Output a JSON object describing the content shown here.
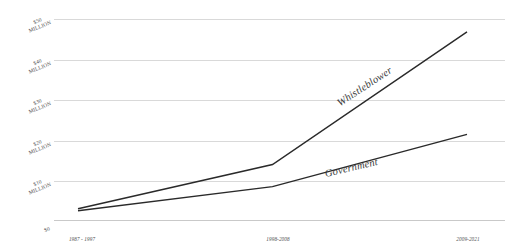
{
  "chart_data": {
    "type": "line",
    "title": "",
    "subtitle": "",
    "xlabel": "",
    "ylabel": "",
    "categories": [
      "1987 - 1997",
      "1998-2008",
      "2009-2021"
    ],
    "x": [
      0,
      1,
      2
    ],
    "ylim": [
      0,
      50
    ],
    "xlim": [
      0,
      2
    ],
    "y_unit": "millions of dollars",
    "grid": true,
    "legend_position": "inline-labels",
    "y_tick_values": [
      0,
      10,
      20,
      30,
      40,
      50
    ],
    "y_tick_labels": [
      "$0",
      "$10\nMILLION",
      "$20\nMILLION",
      "$30\nMILLION",
      "$40\nMILLION",
      "$50\nMILLION"
    ],
    "series": [
      {
        "name": "Whistleblower",
        "label": "Whistleblower",
        "color": "#2a2a2a",
        "values": [
          2.8,
          13.8,
          46.8
        ]
      },
      {
        "name": "Government",
        "label": "Government",
        "color": "#2a2a2a",
        "values": [
          2.3,
          8.3,
          21.3
        ]
      }
    ],
    "annotations": [
      {
        "text": "Whistleblower",
        "style": "italic",
        "placement": "along-upper-line"
      },
      {
        "text": "Government",
        "style": "italic",
        "placement": "along-lower-line"
      }
    ]
  },
  "colors": {
    "background": "#ffffff",
    "gridline": "#d9d9d9",
    "axis_baseline": "#c9c9c9",
    "line": "#2a2a2a",
    "text": "#4a4a4a"
  }
}
